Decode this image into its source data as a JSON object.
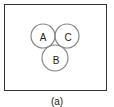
{
  "figure": {
    "caption": "(a)",
    "sets": [
      {
        "id": "A",
        "label": "A",
        "cx": 43,
        "cy": 36,
        "r": 12
      },
      {
        "id": "C",
        "label": "C",
        "cx": 67,
        "cy": 36,
        "r": 12
      },
      {
        "id": "B",
        "label": "B",
        "cx": 55,
        "cy": 58,
        "r": 13
      }
    ],
    "stroke_color": "#888888",
    "frame_color": "#333333"
  }
}
